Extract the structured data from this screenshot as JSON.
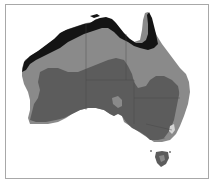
{
  "map": {
    "subject": "Australia zone map",
    "zones": [
      {
        "name": "zone-tropical-north",
        "color": "#141414"
      },
      {
        "name": "zone-mid",
        "color": "#8a8a8a"
      },
      {
        "name": "zone-interior-south",
        "color": "#5c5c5c"
      },
      {
        "name": "zone-alpine",
        "color": "#d4d4d4"
      }
    ],
    "frame_color": "#a8a8a8"
  }
}
